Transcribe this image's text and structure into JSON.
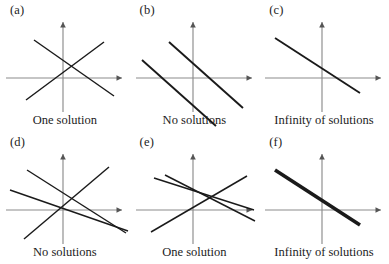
{
  "figure": {
    "background_color": "#ffffff",
    "line_color": "#1a1a1a",
    "axis_color": "#8c8c8c",
    "text_color": "#1c1c1c",
    "columns": 3,
    "rows": 2,
    "panel_width": 129.6,
    "panel_height": 132
  },
  "panels": [
    {
      "id": "a",
      "label": "(a)",
      "caption": "One solution",
      "x": 0,
      "y": 0,
      "axes": {
        "origin_x": 63,
        "origin_y": 62,
        "x_min": 6,
        "x_max": 122,
        "y_min": 6,
        "y_max": 96
      },
      "line_count": 2,
      "lines": [
        {
          "name": "line-1",
          "weight": "thin",
          "x1": 26,
          "y1": 84,
          "x2": 104,
          "y2": 26
        },
        {
          "name": "line-2",
          "weight": "thin",
          "x1": 34,
          "y1": 24,
          "x2": 114,
          "y2": 80
        }
      ]
    },
    {
      "id": "b",
      "label": "(b)",
      "caption": "No solutions",
      "x": 129.6,
      "y": 0,
      "axes": {
        "origin_x": 63,
        "origin_y": 62,
        "x_min": 6,
        "x_max": 122,
        "y_min": 6,
        "y_max": 96
      },
      "line_count": 2,
      "lines": [
        {
          "name": "line-1",
          "weight": "med",
          "x1": 39,
          "y1": 26,
          "x2": 113,
          "y2": 92
        },
        {
          "name": "line-2",
          "weight": "med",
          "x1": 12,
          "y1": 44,
          "x2": 86,
          "y2": 110
        }
      ]
    },
    {
      "id": "c",
      "label": "(c)",
      "caption": "Infinity of solutions",
      "x": 259.2,
      "y": 0,
      "axes": {
        "origin_x": 63,
        "origin_y": 62,
        "x_min": 6,
        "x_max": 122,
        "y_min": 6,
        "y_max": 96
      },
      "line_count": 1,
      "lines": [
        {
          "name": "line-1",
          "weight": "med",
          "x1": 16,
          "y1": 22,
          "x2": 101,
          "y2": 77
        }
      ]
    },
    {
      "id": "d",
      "label": "(d)",
      "caption": "No solutions",
      "x": 0,
      "y": 132,
      "axes": {
        "origin_x": 63,
        "origin_y": 62,
        "x_min": 6,
        "x_max": 122,
        "y_min": 6,
        "y_max": 96
      },
      "line_count": 3,
      "lines": [
        {
          "name": "line-1",
          "weight": "thin",
          "x1": 27,
          "y1": 22,
          "x2": 126,
          "y2": 85
        },
        {
          "name": "line-2",
          "weight": "thin",
          "x1": 10,
          "y1": 42,
          "x2": 128,
          "y2": 83
        },
        {
          "name": "line-3",
          "weight": "thin",
          "x1": 24,
          "y1": 91,
          "x2": 109,
          "y2": 19
        }
      ]
    },
    {
      "id": "e",
      "label": "(e)",
      "caption": "One solution",
      "x": 129.6,
      "y": 132,
      "axes": {
        "origin_x": 63,
        "origin_y": 62,
        "x_min": 6,
        "x_max": 122,
        "y_min": 6,
        "y_max": 96
      },
      "line_count": 3,
      "lines": [
        {
          "name": "line-1",
          "weight": "thin",
          "x1": 24,
          "y1": 30,
          "x2": 124,
          "y2": 62
        },
        {
          "name": "line-2",
          "weight": "thin",
          "x1": 21,
          "y1": 84,
          "x2": 117,
          "y2": 28
        },
        {
          "name": "line-3",
          "weight": "thin",
          "x1": 35,
          "y1": 27,
          "x2": 125,
          "y2": 73
        }
      ]
    },
    {
      "id": "f",
      "label": "(f)",
      "caption": "Infinity of solutions",
      "x": 259.2,
      "y": 132,
      "axes": {
        "origin_x": 63,
        "origin_y": 62,
        "x_min": 6,
        "x_max": 122,
        "y_min": 6,
        "y_max": 96
      },
      "line_count": 1,
      "lines": [
        {
          "name": "line-1",
          "weight": "thick",
          "x1": 16,
          "y1": 22,
          "x2": 101,
          "y2": 77
        }
      ]
    }
  ]
}
